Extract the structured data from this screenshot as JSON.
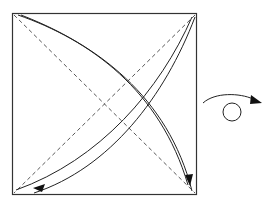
{
  "diagram": {
    "type": "origami-fold-instruction",
    "square": {
      "x": 12,
      "y": 13,
      "size": 184,
      "stroke": "#333333"
    },
    "fold_lines": [
      {
        "name": "diagonal-tl-br",
        "style": "dashed",
        "from": [
          12,
          13
        ],
        "to": [
          196,
          194
        ]
      },
      {
        "name": "diagonal-tr-bl",
        "style": "dashed",
        "from": [
          196,
          13
        ],
        "to": [
          12,
          194
        ]
      }
    ],
    "arrows": [
      {
        "name": "fold-arrow-tl-to-br",
        "direction": "top-left to bottom-right"
      },
      {
        "name": "fold-arrow-tr-to-bl",
        "direction": "top-right to bottom-left"
      }
    ],
    "symbols": [
      {
        "name": "turn-over-symbol",
        "meaning": "turn paper over"
      }
    ]
  }
}
